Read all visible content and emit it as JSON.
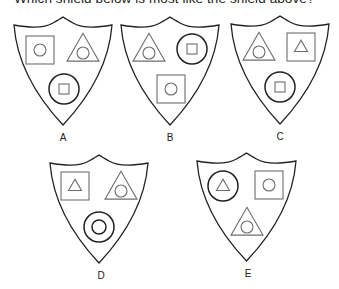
{
  "question": "Which shield below is most like the shield above?",
  "shields": [
    {
      "label": "A",
      "box": {
        "x": 14,
        "y": 17,
        "w": 98,
        "h": 108
      },
      "slots": [
        {
          "pos": "top-left",
          "outer": "square",
          "inner": "circle",
          "cx": 40,
          "cy": 50
        },
        {
          "pos": "top-right",
          "outer": "triangle",
          "inner": "circle",
          "cx": 83,
          "cy": 50
        },
        {
          "pos": "bottom",
          "outer": "circle",
          "inner": "square",
          "cx": 64,
          "cy": 89
        }
      ],
      "label_pos": {
        "x": 63,
        "y": 141
      }
    },
    {
      "label": "B",
      "box": {
        "x": 121,
        "y": 17,
        "w": 98,
        "h": 108
      },
      "slots": [
        {
          "pos": "top-left",
          "outer": "triangle",
          "inner": "circle",
          "cx": 149,
          "cy": 50
        },
        {
          "pos": "top-right",
          "outer": "circle",
          "inner": "square",
          "cx": 192,
          "cy": 49
        },
        {
          "pos": "bottom",
          "outer": "square",
          "inner": "circle",
          "cx": 171,
          "cy": 89
        }
      ],
      "label_pos": {
        "x": 170,
        "y": 141
      }
    },
    {
      "label": "C",
      "box": {
        "x": 231,
        "y": 16,
        "w": 98,
        "h": 108
      },
      "slots": [
        {
          "pos": "top-left",
          "outer": "triangle",
          "inner": "circle",
          "cx": 259,
          "cy": 49
        },
        {
          "pos": "top-right",
          "outer": "square",
          "inner": "triangle",
          "cx": 301,
          "cy": 47
        },
        {
          "pos": "bottom",
          "outer": "circle",
          "inner": "square",
          "cx": 280,
          "cy": 87
        }
      ],
      "label_pos": {
        "x": 280,
        "y": 140
      }
    },
    {
      "label": "D",
      "box": {
        "x": 50,
        "y": 155,
        "w": 98,
        "h": 108
      },
      "slots": [
        {
          "pos": "top-left",
          "outer": "square",
          "inner": "triangle",
          "cx": 75,
          "cy": 186
        },
        {
          "pos": "top-right",
          "outer": "triangle",
          "inner": "circle",
          "cx": 121,
          "cy": 188
        },
        {
          "pos": "bottom",
          "outer": "circle",
          "inner": "circle",
          "cx": 99,
          "cy": 227
        }
      ],
      "label_pos": {
        "x": 101,
        "y": 279
      }
    },
    {
      "label": "E",
      "box": {
        "x": 197,
        "y": 153,
        "w": 99,
        "h": 108
      },
      "slots": [
        {
          "pos": "top-left",
          "outer": "circle",
          "inner": "triangle",
          "cx": 223,
          "cy": 186
        },
        {
          "pos": "top-right",
          "outer": "square",
          "inner": "circle",
          "cx": 269,
          "cy": 185
        },
        {
          "pos": "bottom",
          "outer": "triangle",
          "inner": "circle",
          "cx": 247,
          "cy": 224
        }
      ],
      "label_pos": {
        "x": 248,
        "y": 277
      }
    }
  ],
  "colors": {
    "stroke_dark": "#222222",
    "stroke_gray": "#6e6e6e",
    "background": "#ffffff"
  }
}
